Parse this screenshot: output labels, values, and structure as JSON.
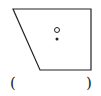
{
  "diagram": {
    "shape": "trapezoid",
    "vertices": [
      [
        13,
        9
      ],
      [
        91,
        9
      ],
      [
        91,
        70
      ],
      [
        40,
        70
      ]
    ],
    "stroke_color": "#222222",
    "hollow_circle": {
      "cx": 57,
      "cy": 30,
      "r": 2.5
    },
    "dot": {
      "cx": 57,
      "cy": 39,
      "r": 1.5
    }
  },
  "answer_blank": {
    "left_paren": "(",
    "right_paren": ")"
  }
}
